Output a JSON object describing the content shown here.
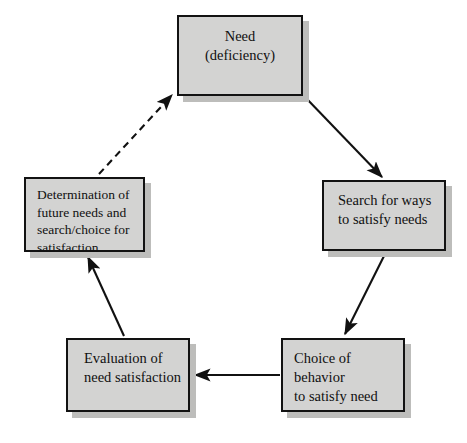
{
  "diagram": {
    "style": {
      "node_fill": "#d3d3d2",
      "node_border": "#121212",
      "node_shadow": "#bdbdbb",
      "arrow_color": "#111111",
      "background": "#ffffff"
    },
    "nodes": [
      {
        "id": "need",
        "label": "Need\n(deficiency)"
      },
      {
        "id": "search",
        "label": "Search for ways\nto satisfy needs"
      },
      {
        "id": "choice",
        "label": "Choice of behavior\nto satisfy need"
      },
      {
        "id": "evaluation",
        "label": "Evaluation of\nneed satisfaction"
      },
      {
        "id": "determination",
        "label": "Determination of\nfuture needs and\nsearch/choice for\nsatisfaction"
      }
    ],
    "edges": [
      {
        "id": "need-to-search",
        "from": "need",
        "to": "search",
        "style": "solid"
      },
      {
        "id": "search-to-choice",
        "from": "search",
        "to": "choice",
        "style": "solid"
      },
      {
        "id": "choice-to-evaluation",
        "from": "choice",
        "to": "evaluation",
        "style": "solid"
      },
      {
        "id": "evaluation-to-determination",
        "from": "evaluation",
        "to": "determination",
        "style": "solid"
      },
      {
        "id": "determination-to-need",
        "from": "determination",
        "to": "need",
        "style": "dashed"
      }
    ]
  }
}
